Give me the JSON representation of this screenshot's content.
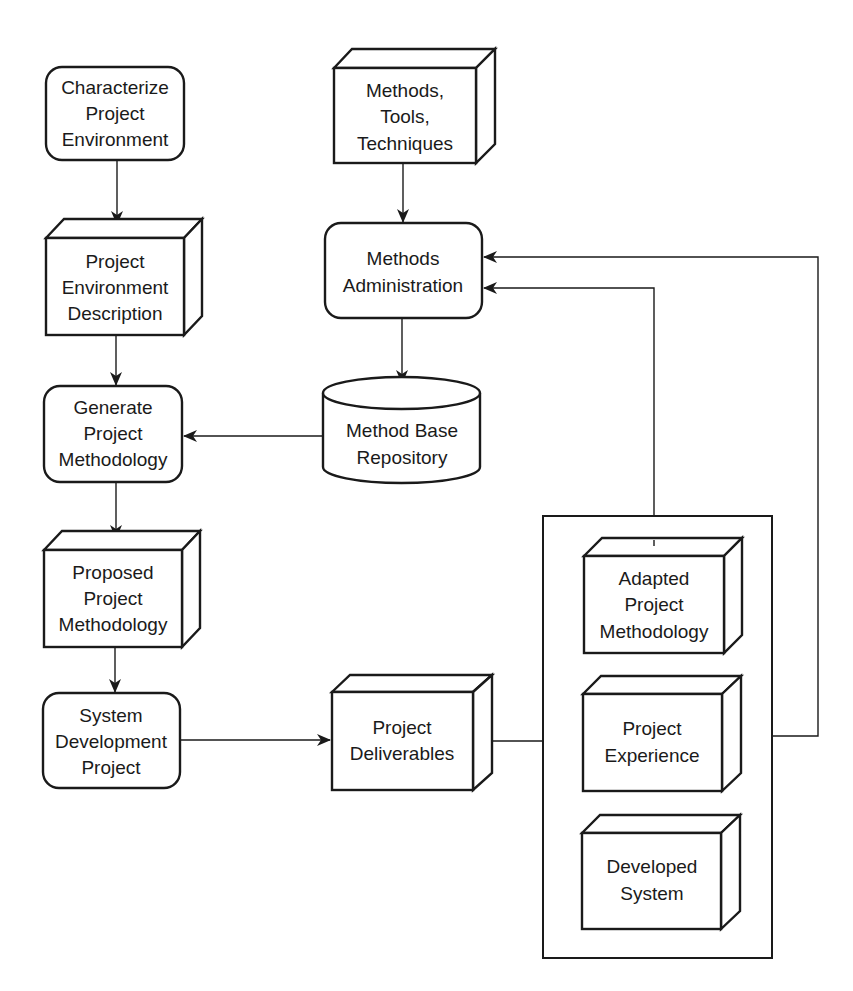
{
  "diagram": {
    "type": "flowchart",
    "nodes": {
      "characterize": {
        "shape": "process",
        "lines": [
          "Characterize",
          "Project",
          "Environment"
        ]
      },
      "env_description": {
        "shape": "artifact-box",
        "lines": [
          "Project",
          "Environment",
          "Description"
        ]
      },
      "generate": {
        "shape": "process",
        "lines": [
          "Generate",
          "Project",
          "Methodology"
        ]
      },
      "proposed": {
        "shape": "artifact-box",
        "lines": [
          "Proposed",
          "Project",
          "Methodology"
        ]
      },
      "sysdev": {
        "shape": "process",
        "lines": [
          "System",
          "Development",
          "Project"
        ]
      },
      "methods_tools": {
        "shape": "artifact-box",
        "lines": [
          "Methods,",
          "Tools,",
          "Techniques"
        ]
      },
      "methods_admin": {
        "shape": "process",
        "lines": [
          "Methods",
          "Administration"
        ]
      },
      "repository": {
        "shape": "database",
        "lines": [
          "Method Base",
          "Repository"
        ]
      },
      "deliverables": {
        "shape": "artifact-box",
        "lines": [
          "Project",
          "Deliverables"
        ]
      },
      "adapted": {
        "shape": "artifact-box",
        "lines": [
          "Adapted",
          "Project",
          "Methodology"
        ]
      },
      "experience": {
        "shape": "artifact-box",
        "lines": [
          "Project",
          "Experience"
        ]
      },
      "developed": {
        "shape": "artifact-box",
        "lines": [
          "Developed",
          "System"
        ]
      }
    },
    "groups": [
      {
        "id": "deliverables-group",
        "members": [
          "adapted",
          "experience",
          "developed"
        ]
      }
    ],
    "edges": [
      {
        "from": "characterize",
        "to": "env_description",
        "arrow": true
      },
      {
        "from": "env_description",
        "to": "generate",
        "arrow": true
      },
      {
        "from": "generate",
        "to": "proposed",
        "arrow": true
      },
      {
        "from": "proposed",
        "to": "sysdev",
        "arrow": true
      },
      {
        "from": "methods_tools",
        "to": "methods_admin",
        "arrow": true
      },
      {
        "from": "methods_admin",
        "to": "repository",
        "arrow": true
      },
      {
        "from": "repository",
        "to": "generate",
        "arrow": true
      },
      {
        "from": "sysdev",
        "to": "deliverables",
        "arrow": true
      },
      {
        "from": "deliverables",
        "to": "deliverables-group",
        "arrow": false
      },
      {
        "from": "adapted",
        "to": "methods_admin",
        "arrow": true
      },
      {
        "from": "experience",
        "to": "methods_admin",
        "arrow": true
      }
    ]
  }
}
